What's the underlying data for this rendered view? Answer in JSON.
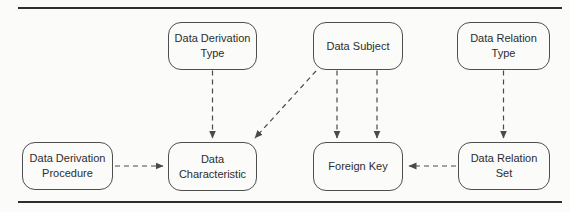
{
  "diagram": {
    "nodes": [
      {
        "id": "data-derivation-type",
        "label": "Data Derivation Type"
      },
      {
        "id": "data-subject",
        "label": "Data Subject"
      },
      {
        "id": "data-relation-type",
        "label": "Data Relation Type"
      },
      {
        "id": "data-derivation-procedure",
        "label": "Data Derivation Procedure"
      },
      {
        "id": "data-characteristic",
        "label": "Data Characteristic"
      },
      {
        "id": "foreign-key",
        "label": "Foreign Key"
      },
      {
        "id": "data-relation-set",
        "label": "Data Relation Set"
      }
    ],
    "edges": [
      {
        "from": "Data Derivation Type",
        "to": "Data Characteristic",
        "style": "dashed-arrow"
      },
      {
        "from": "Data Subject",
        "to": "Data Characteristic",
        "style": "dashed-arrow"
      },
      {
        "from": "Data Subject",
        "to": "Foreign Key",
        "style": "dashed-arrow"
      },
      {
        "from": "Data Subject",
        "to": "Foreign Key",
        "style": "dashed-arrow"
      },
      {
        "from": "Data Relation Type",
        "to": "Data Relation Set",
        "style": "dashed-arrow"
      },
      {
        "from": "Data Derivation Procedure",
        "to": "Data Characteristic",
        "style": "dashed-arrow"
      },
      {
        "from": "Data Relation Set",
        "to": "Foreign Key",
        "style": "dashed-arrow"
      }
    ]
  },
  "colors": {
    "line": "#4a4a4a",
    "rule": "#2e2e2e",
    "text": "#2d2d2d",
    "node-border": "#4f4f4f",
    "background": "#fbfbf9"
  }
}
